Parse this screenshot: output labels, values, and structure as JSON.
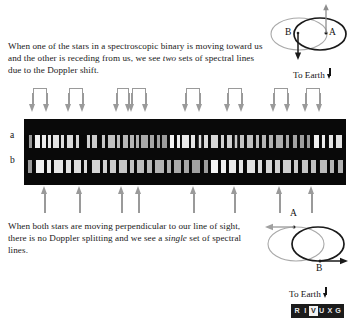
{
  "figure": {
    "caption_top": "When one of the stars in a spectroscopic binary is moving toward us and the other is receding from us, we see two sets of spectral lines due to the Doppler shift.",
    "caption_top_parts": {
      "before": "When one of the stars in a spectroscopic binary is moving toward us and the other is receding from us, we see ",
      "italic": "two",
      "after": " sets of spectral lines due to the Doppler shift."
    },
    "caption_bottom_parts": {
      "before": "When both stars are moving perpendicular to our line of sight, there is no Doppler splitting and we see a ",
      "italic": "single",
      "after": " set of spectral lines."
    }
  },
  "spectra": {
    "strip_a_label": "a",
    "strip_b_label": "b",
    "background_color": "#090909",
    "line_color": "#f4f4f4",
    "strip_a_lines": [
      {
        "x": 1.5,
        "w": 1.1
      },
      {
        "x": 3.4,
        "w": 1.6
      },
      {
        "x": 5.6,
        "w": 1.2
      },
      {
        "x": 7.4,
        "w": 0.9
      },
      {
        "x": 9.0,
        "w": 1.8
      },
      {
        "x": 11.4,
        "w": 1.1
      },
      {
        "x": 13.2,
        "w": 2.1
      },
      {
        "x": 16.0,
        "w": 1.0
      },
      {
        "x": 19.6,
        "w": 0.8
      },
      {
        "x": 21.2,
        "w": 1.4
      },
      {
        "x": 24.2,
        "w": 1.1
      },
      {
        "x": 26.0,
        "w": 2.3
      },
      {
        "x": 29.0,
        "w": 0.9
      },
      {
        "x": 30.6,
        "w": 1.7
      },
      {
        "x": 33.0,
        "w": 1.1
      },
      {
        "x": 34.8,
        "w": 0.8
      },
      {
        "x": 36.4,
        "w": 2.0
      },
      {
        "x": 39.2,
        "w": 1.2
      },
      {
        "x": 41.2,
        "w": 0.9
      },
      {
        "x": 43.0,
        "w": 1.5
      },
      {
        "x": 45.4,
        "w": 1.1
      },
      {
        "x": 47.4,
        "w": 0.9
      },
      {
        "x": 49.2,
        "w": 1.9
      },
      {
        "x": 52.0,
        "w": 1.2
      },
      {
        "x": 54.2,
        "w": 0.8
      },
      {
        "x": 55.8,
        "w": 1.4
      },
      {
        "x": 58.2,
        "w": 2.2
      },
      {
        "x": 61.2,
        "w": 1.0
      },
      {
        "x": 63.0,
        "w": 1.6
      },
      {
        "x": 65.4,
        "w": 0.9
      },
      {
        "x": 67.2,
        "w": 1.2
      },
      {
        "x": 69.4,
        "w": 1.8
      },
      {
        "x": 72.0,
        "w": 0.9
      },
      {
        "x": 74.0,
        "w": 1.3
      },
      {
        "x": 76.2,
        "w": 1.0
      },
      {
        "x": 78.4,
        "w": 2.1
      },
      {
        "x": 81.4,
        "w": 0.9
      },
      {
        "x": 83.4,
        "w": 1.5
      },
      {
        "x": 85.8,
        "w": 1.1
      },
      {
        "x": 88.0,
        "w": 0.8
      },
      {
        "x": 90.0,
        "w": 1.7
      },
      {
        "x": 92.6,
        "w": 1.0
      },
      {
        "x": 94.8,
        "w": 1.3
      },
      {
        "x": 97.0,
        "w": 1.8
      }
    ],
    "strip_b_lines": [
      {
        "x": 1.2,
        "w": 1.4
      },
      {
        "x": 3.6,
        "w": 2.6
      },
      {
        "x": 7.2,
        "w": 1.2
      },
      {
        "x": 9.2,
        "w": 2.9
      },
      {
        "x": 13.0,
        "w": 1.5
      },
      {
        "x": 15.4,
        "w": 2.2
      },
      {
        "x": 18.6,
        "w": 1.1
      },
      {
        "x": 21.0,
        "w": 2.7
      },
      {
        "x": 24.6,
        "w": 1.3
      },
      {
        "x": 26.8,
        "w": 1.8
      },
      {
        "x": 29.6,
        "w": 2.4
      },
      {
        "x": 33.0,
        "w": 1.2
      },
      {
        "x": 35.2,
        "w": 2.0
      },
      {
        "x": 38.2,
        "w": 1.4
      },
      {
        "x": 40.6,
        "w": 2.8
      },
      {
        "x": 44.4,
        "w": 1.2
      },
      {
        "x": 46.6,
        "w": 2.1
      },
      {
        "x": 49.6,
        "w": 1.5
      },
      {
        "x": 52.2,
        "w": 2.5
      },
      {
        "x": 55.8,
        "w": 1.2
      },
      {
        "x": 58.0,
        "w": 2.3
      },
      {
        "x": 61.2,
        "w": 1.6
      },
      {
        "x": 63.8,
        "w": 2.0
      },
      {
        "x": 66.8,
        "w": 1.3
      },
      {
        "x": 69.2,
        "w": 2.6
      },
      {
        "x": 72.8,
        "w": 1.2
      },
      {
        "x": 75.0,
        "w": 1.9
      },
      {
        "x": 78.0,
        "w": 1.4
      },
      {
        "x": 80.4,
        "w": 2.4
      },
      {
        "x": 83.8,
        "w": 1.2
      },
      {
        "x": 86.2,
        "w": 2.0
      },
      {
        "x": 89.2,
        "w": 1.5
      },
      {
        "x": 91.8,
        "w": 2.2
      },
      {
        "x": 95.0,
        "w": 1.3
      },
      {
        "x": 97.4,
        "w": 1.8
      }
    ]
  },
  "markers": {
    "top_color": "#9a9a9a",
    "bottom_color": "#9a9a9a",
    "top_pairs": [
      {
        "left": 33,
        "right": 47
      },
      {
        "left": 69,
        "right": 83
      },
      {
        "left": 117,
        "right": 129
      },
      {
        "left": 132,
        "right": 146
      },
      {
        "left": 186,
        "right": 200
      },
      {
        "left": 228,
        "right": 242
      },
      {
        "left": 274,
        "right": 288
      },
      {
        "left": 306,
        "right": 320
      }
    ],
    "bottom_singles": [
      45,
      80,
      122,
      139,
      194,
      235,
      280,
      312
    ]
  },
  "orbit_top": {
    "label_a": "A",
    "label_b": "B",
    "to_earth": "To Earth",
    "star_a_direction": "up",
    "star_b_direction": "down"
  },
  "orbit_bottom": {
    "label_a": "A",
    "label_b": "B",
    "to_earth": "To Earth",
    "star_a_direction": "left",
    "star_b_direction": "right"
  },
  "rivuxg": {
    "letters": [
      "R",
      "I",
      "V",
      "U",
      "X",
      "G"
    ],
    "active_index": 2
  }
}
